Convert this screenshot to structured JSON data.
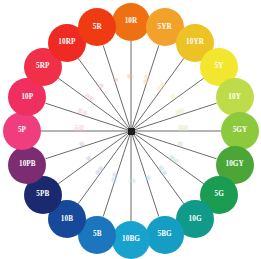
{
  "chart_data": {
    "type": "pie",
    "subtitle": "20 principal hues",
    "legend_position": "none",
    "grid": false,
    "center": {
      "x": 131,
      "y": 131,
      "hub_color": "#1c1c1c"
    },
    "spoke_color": "#5a5a5a",
    "disc_radius": 19,
    "ring_radius": 109,
    "categories": [
      "10R",
      "5YR",
      "10YR",
      "5Y",
      "10Y",
      "5GY",
      "10GY",
      "5G",
      "10G",
      "5BG",
      "10BG",
      "5B",
      "10B",
      "5PB",
      "10PB",
      "5P",
      "10P",
      "5RP",
      "10RP",
      "5R"
    ],
    "values": [
      18,
      18,
      18,
      18,
      18,
      18,
      18,
      18,
      18,
      18,
      18,
      18,
      18,
      18,
      18,
      18,
      18,
      18,
      18,
      18
    ],
    "xlabel": "",
    "ylabel": "",
    "segments": [
      {
        "label": "10R",
        "color": "#ef7013",
        "text_color": "#ffffff",
        "angle": -90,
        "inner": "赤",
        "inner_color": "#f0b58a"
      },
      {
        "label": "5YR",
        "color": "#f2a22a",
        "text_color": "#ffffff",
        "angle": -72,
        "inner": "黄赤",
        "inner_color": "#f3d6a4"
      },
      {
        "label": "10YR",
        "color": "#edc224",
        "text_color": "#ffffff",
        "angle": -54,
        "inner": "赤黄",
        "inner_color": "#f1e4ae"
      },
      {
        "label": "5Y",
        "color": "#f2e62e",
        "text_color": "#ffffff",
        "angle": -36,
        "inner": "黄",
        "inner_color": "#f2eeb8"
      },
      {
        "label": "10Y",
        "color": "#bedb4a",
        "text_color": "#ffffff",
        "angle": -18,
        "inner": "緑黄",
        "inner_color": "#e0eaba"
      },
      {
        "label": "5GY",
        "color": "#8cc93c",
        "text_color": "#ffffff",
        "angle": 0,
        "inner": "黄緑",
        "inner_color": "#d2e7b4"
      },
      {
        "label": "10GY",
        "color": "#4ba637",
        "text_color": "#ffffff",
        "angle": 18,
        "inner": "緑",
        "inner_color": "#bfe0bd"
      },
      {
        "label": "5G",
        "color": "#1a9c52",
        "text_color": "#ffffff",
        "answer": "",
        "inner": "青緑",
        "inner_color": "#b5dcc6"
      },
      {
        "label": "10G",
        "color": "#11998a",
        "text_color": "#ffffff",
        "angle": 54,
        "inner": "緑青",
        "inner_color": "#aedad6"
      },
      {
        "label": "5BG",
        "color": "#159dc4",
        "text_color": "#ffffff",
        "angle": 72,
        "inner": "青",
        "inner_color": "#b0dbea"
      },
      {
        "label": "10BG",
        "color": "#1aa2cf",
        "text_color": "#ffffff",
        "angle": 90,
        "inner": "青",
        "inner_color": "#b4dcec"
      },
      {
        "label": "5B",
        "color": "#1b76bd",
        "text_color": "#ffffff",
        "angle": 108,
        "inner": "紫青",
        "inner_color": "#b9d3ea"
      },
      {
        "label": "10B",
        "color": "#16499a",
        "text_color": "#ffffff",
        "angle": 126,
        "inner": "青紫",
        "inner_color": "#bcc6e4"
      },
      {
        "label": "5PB",
        "color": "#1b2a6e",
        "text_color": "#ffffff",
        "angle": 144,
        "inner": "紫",
        "inner_color": "#c2c0df"
      },
      {
        "label": "10PB",
        "color": "#7c2d72",
        "text_color": "#ffffff",
        "angle": 162,
        "inner": "紫",
        "inner_color": "#d5bcd8"
      },
      {
        "label": "5P",
        "color": "#ef3d7e",
        "text_color": "#ffffff",
        "angle": 180,
        "inner": "赤紫",
        "inner_color": "#f4c2d6"
      },
      {
        "label": "10P",
        "color": "#ef2f60",
        "text_color": "#ffffff",
        "angle": 198,
        "inner": "紫赤",
        "inner_color": "#f6bfc9"
      },
      {
        "label": "5RP",
        "color": "#f03048",
        "text_color": "#ffffff",
        "angle": 216,
        "inner": "赤紫",
        "inner_color": "#f7bcbf"
      },
      {
        "label": "10RP",
        "color": "#ef2a22",
        "text_color": "#ffffff",
        "angle": 234,
        "inner": "赤",
        "inner_color": "#f5b8b1"
      },
      {
        "label": "5R",
        "color": "#f03a12",
        "text_color": "#ffffff",
        "angle": 252,
        "inner": "赤",
        "inner_color": "#f3b7a4"
      }
    ]
  }
}
